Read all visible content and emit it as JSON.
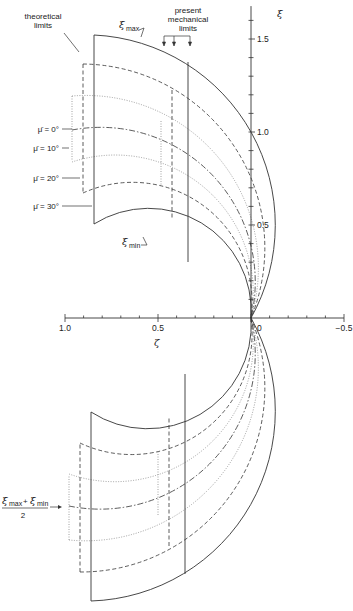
{
  "figure": {
    "axes": {
      "horizontal": {
        "symbol": "ζ",
        "ticks": [
          {
            "value": 1.0,
            "label": "1.0"
          },
          {
            "value": 0.5,
            "label": "0.5"
          },
          {
            "value": 0,
            "label": "0"
          },
          {
            "value": -0.5,
            "label": "−0.5"
          }
        ],
        "range": [
          1.0,
          -0.5
        ],
        "minor_step": 0.1
      },
      "vertical": {
        "symbol": "ξ",
        "ticks": [
          {
            "value": 0.5,
            "label": "0.5"
          },
          {
            "value": 1.0,
            "label": "1.0"
          },
          {
            "value": 1.5,
            "label": "1.5"
          }
        ],
        "range": [
          0,
          1.65
        ],
        "minor_step": 0.1
      }
    },
    "annotations": {
      "theoretical_limits": [
        "theoretical",
        "limits"
      ],
      "present_mechanical_limits": [
        "present",
        "mechanical",
        "limits"
      ],
      "xi_max": {
        "symbol": "ξ",
        "subscript": "max"
      },
      "xi_min": {
        "symbol": "ξ",
        "subscript": "min"
      },
      "mean_label": {
        "numerator_a": "ξ",
        "sub_a": "max",
        "plus": "+",
        "numerator_b": "ξ",
        "sub_b": "min",
        "denominator": "2"
      }
    },
    "mu_labels": [
      {
        "text": "μ̄ = 0°"
      },
      {
        "text": "μ̄ = 10°"
      },
      {
        "text": "μ̄ = 20°"
      },
      {
        "text": "μ̄ = 30°"
      }
    ],
    "curves": [
      {
        "name": "xi-max",
        "style": "solid"
      },
      {
        "name": "mu-30-upper",
        "style": "dashed"
      },
      {
        "name": "mu-20-upper",
        "style": "dotted"
      },
      {
        "name": "mean",
        "style": "dashdot"
      },
      {
        "name": "mu-20-lower",
        "style": "dotted"
      },
      {
        "name": "mu-30-lower",
        "style": "dashed"
      },
      {
        "name": "xi-min",
        "style": "solid"
      }
    ],
    "colors": {
      "ink": "#333333",
      "light_ink": "#888888",
      "background": "#ffffff"
    }
  }
}
